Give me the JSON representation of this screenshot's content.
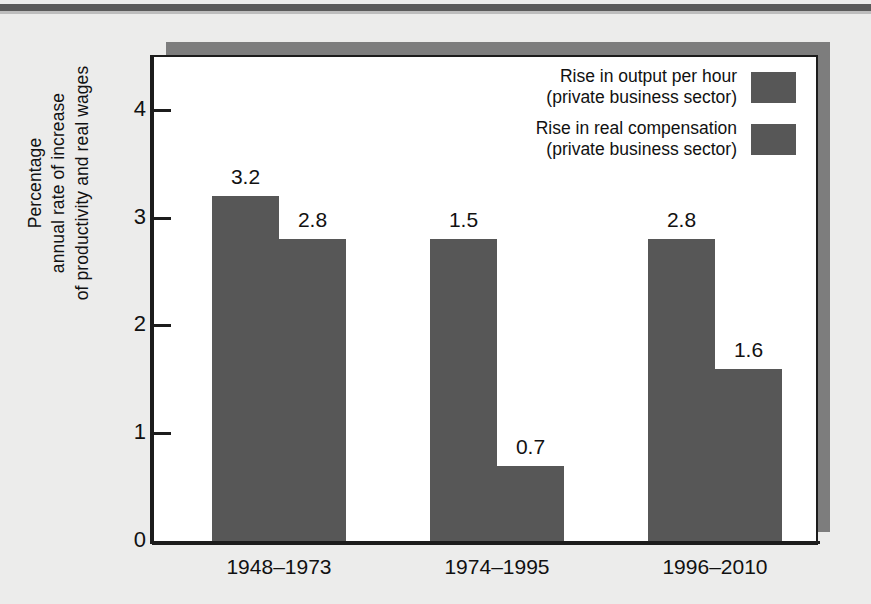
{
  "chart_data": {
    "type": "bar",
    "title": "",
    "xlabel": "",
    "ylabel": "Percentage annual rate of increase of productivity and real wages",
    "ylabel_lines": [
      "Percentage",
      "annual rate of increase",
      "of productivity and real wages"
    ],
    "categories": [
      "1948–1973",
      "1974–1995",
      "1996–2010"
    ],
    "series": [
      {
        "name": "Rise in output per hour (private business sector)",
        "name_lines": [
          "Rise in output per hour",
          "(private business sector)"
        ],
        "values": [
          3.2,
          2.8,
          2.8
        ],
        "value_labels": [
          "3.2",
          "1.5",
          "2.8"
        ],
        "color": "#575757"
      },
      {
        "name": "Rise in real compensation (private business sector)",
        "name_lines": [
          "Rise in real compensation",
          "(private business sector)"
        ],
        "values": [
          2.8,
          0.7,
          1.6
        ],
        "value_labels": [
          "2.8",
          "0.7",
          "1.6"
        ],
        "color": "#575757"
      }
    ],
    "yticks": [
      0,
      1,
      2,
      3,
      4
    ],
    "ytick_labels": [
      "0",
      "1",
      "2",
      "3",
      "4"
    ],
    "ylim": [
      0,
      4.5
    ],
    "grid": false,
    "legend_position": "top-right"
  },
  "colors": {
    "bar": "#575757",
    "panel_background": "#ffffff",
    "page_background": "#ececeb",
    "axis": "#1c1c1c",
    "shadow": "#7d7d7d",
    "text": "#111111"
  }
}
